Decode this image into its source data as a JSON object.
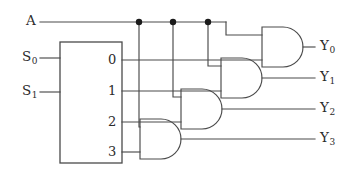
{
  "diagram": {
    "type": "logic-circuit",
    "colors": {
      "wire": "#4a4a4a",
      "junction": "#1a1a1a",
      "text": "#2b2b2b",
      "background": "#ffffff"
    },
    "inputs": [
      {
        "id": "A",
        "label": "A",
        "sub": "",
        "x": 26,
        "y": 18
      },
      {
        "id": "S0",
        "label": "S",
        "sub": "0",
        "x": 22,
        "y": 58
      },
      {
        "id": "S1",
        "label": "S",
        "sub": "1",
        "x": 22,
        "y": 92
      }
    ],
    "decoder": {
      "name": "decoder-box",
      "x": 60,
      "y": 42,
      "width": 62,
      "height": 121,
      "output_labels": [
        "0",
        "1",
        "2",
        "3"
      ],
      "output_y": [
        60,
        91,
        122,
        152
      ]
    },
    "gates": [
      {
        "id": "gate-y0",
        "label": "AND",
        "output": "Y0",
        "x": 262,
        "y": 27,
        "width": 42,
        "height": 40
      },
      {
        "id": "gate-y1",
        "label": "AND",
        "output": "Y1",
        "x": 221,
        "y": 58,
        "width": 42,
        "height": 40
      },
      {
        "id": "gate-y2",
        "label": "AND",
        "output": "Y2",
        "x": 181,
        "y": 89,
        "width": 42,
        "height": 40
      },
      {
        "id": "gate-y3",
        "label": "AND",
        "output": "Y3",
        "x": 140,
        "y": 119,
        "width": 42,
        "height": 40
      }
    ],
    "outputs": [
      {
        "id": "Y0",
        "label": "Y",
        "sub": "0",
        "x": 320,
        "y": 40
      },
      {
        "id": "Y1",
        "label": "Y",
        "sub": "1",
        "x": 320,
        "y": 71
      },
      {
        "id": "Y2",
        "label": "Y",
        "sub": "2",
        "x": 320,
        "y": 102
      },
      {
        "id": "Y3",
        "label": "Y",
        "sub": "3",
        "x": 320,
        "y": 132
      }
    ],
    "junctions": [
      {
        "id": "junction-a-y3",
        "x": 139,
        "y": 22
      },
      {
        "id": "junction-a-y2",
        "x": 173,
        "y": 22
      },
      {
        "id": "junction-a-y1",
        "x": 208,
        "y": 22
      }
    ]
  }
}
